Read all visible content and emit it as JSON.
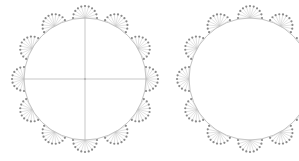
{
  "diagram": {
    "title": "",
    "colors": {
      "background": "#ffffff",
      "circle": "#b5b5b5",
      "axis": "#b0b0b0",
      "spoke": "#c4c4c4",
      "dot": "#8a8a8a"
    },
    "figures": [
      {
        "name": "circle-with-axes",
        "cx": 85,
        "cy": 79,
        "r": 61,
        "axes": true,
        "fans": 12,
        "dots_per_fan": 11,
        "fan_radius": 12
      },
      {
        "name": "circle-plain",
        "cx": 250,
        "cy": 79,
        "r": 61,
        "axes": false,
        "fans": 12,
        "dots_per_fan": 11,
        "fan_radius": 12
      }
    ]
  }
}
